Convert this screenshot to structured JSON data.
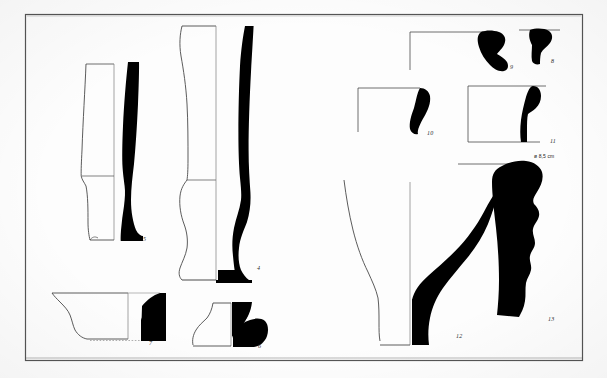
{
  "figure": {
    "kind": "archaeological-pottery-profile-plate",
    "background_color": "#fdfdfd",
    "ink_color": "#000000",
    "outline_color": "#3a3a3a",
    "frame": {
      "x": 25,
      "y": 14,
      "width": 558,
      "height": 347,
      "stroke": "#4a4a4a"
    }
  },
  "annotations": {
    "diameter_label": "ø 8,5 cm"
  },
  "objects": [
    {
      "id": "vessel-4",
      "label": "4",
      "label_x": 259,
      "label_y": 269,
      "description": "tall footed goblet / beaker profile, half-section with solid black right half",
      "type": "goblet"
    },
    {
      "id": "vessel-5",
      "label": "5",
      "label_x": 144,
      "label_y": 240,
      "description": "tall narrow cup / stemmed vessel profile, half-section with solid black right half",
      "type": "cup"
    },
    {
      "id": "vessel-6",
      "label": "6",
      "label_x": 259,
      "label_y": 347,
      "description": "pedestal foot / base profile, half-section with solid black right half",
      "type": "pedestal-base"
    },
    {
      "id": "vessel-7",
      "label": "7",
      "label_x": 150,
      "label_y": 344,
      "description": "shallow bowl rim-to-base profile, half-section with solid black right portion",
      "type": "bowl"
    },
    {
      "id": "sherd-8",
      "label": "8",
      "label_x": 553,
      "label_y": 62,
      "description": "small rim sherd silhouette with rim line",
      "type": "rim-sherd"
    },
    {
      "id": "sherd-9",
      "label": "9",
      "label_x": 512,
      "label_y": 68,
      "description": "small angled rim sherd silhouette with rim line",
      "type": "rim-sherd"
    },
    {
      "id": "sherd-10",
      "label": "10",
      "label_x": 430,
      "label_y": 134,
      "description": "curved wall sherd silhouette with rim line",
      "type": "wall-sherd"
    },
    {
      "id": "sherd-11",
      "label": "11",
      "label_x": 553,
      "label_y": 142,
      "description": "elongated rim / neck sherd silhouette with rim line",
      "type": "rim-sherd"
    },
    {
      "id": "vessel-12",
      "label": "12",
      "label_x": 458,
      "label_y": 337,
      "description": "large bowl / basin profile, half-section with solid black right half",
      "type": "basin"
    },
    {
      "id": "vessel-13",
      "label": "13",
      "label_x": 551,
      "label_y": 320,
      "description": "ribbed / corrugated neck sherd silhouette with diameter indication",
      "type": "ribbed-neck"
    }
  ]
}
